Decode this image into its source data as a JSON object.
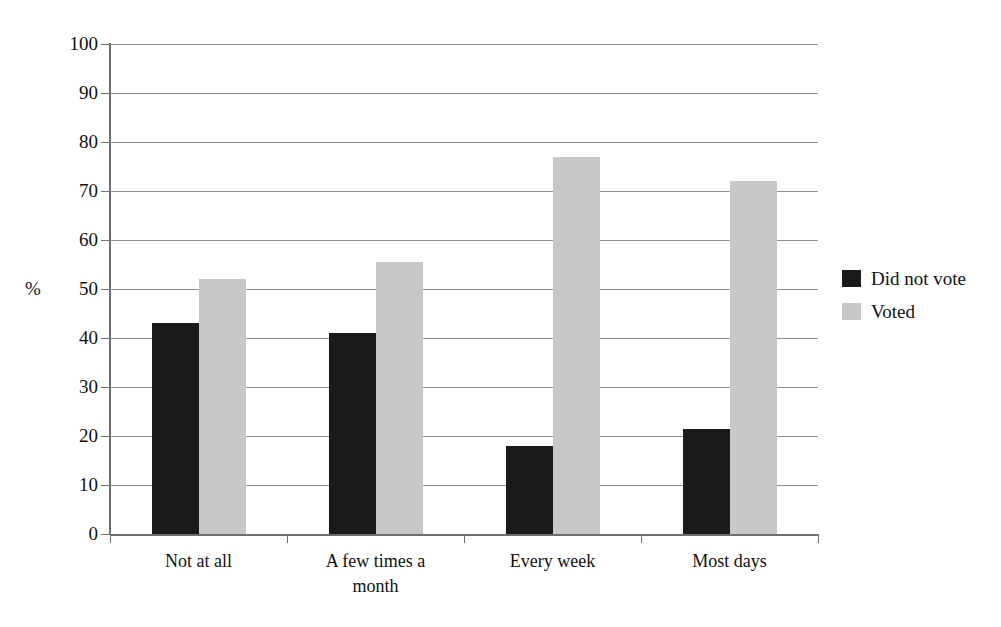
{
  "chart_data": {
    "type": "bar",
    "title": "",
    "subtitle": "",
    "xlabel": "",
    "ylabel": "%",
    "ylim": [
      0,
      100
    ],
    "ytick_step": 10,
    "yticks": [
      100,
      90,
      80,
      70,
      60,
      50,
      40,
      30,
      20,
      10,
      0
    ],
    "grid": true,
    "legend_position": "right",
    "categories": [
      "Not at all",
      "A few times a month",
      "Every week",
      "Most days"
    ],
    "category_lines": [
      [
        "Not at all"
      ],
      [
        "A few times a",
        "month"
      ],
      [
        "Every week"
      ],
      [
        "Most days"
      ]
    ],
    "series": [
      {
        "name": "Did not vote",
        "color": "#1a1a1a",
        "values": [
          43,
          41,
          18,
          21.5
        ]
      },
      {
        "name": "Voted",
        "color": "#c8c8c8",
        "values": [
          52,
          55.5,
          77,
          72
        ]
      }
    ]
  },
  "colors": {
    "series_dark": "#1a1a1a",
    "series_light": "#c8c8c8",
    "gridline": "#8c8c8c",
    "axis": "#6e6e6e",
    "background": "#ffffff",
    "text": "#111111"
  }
}
